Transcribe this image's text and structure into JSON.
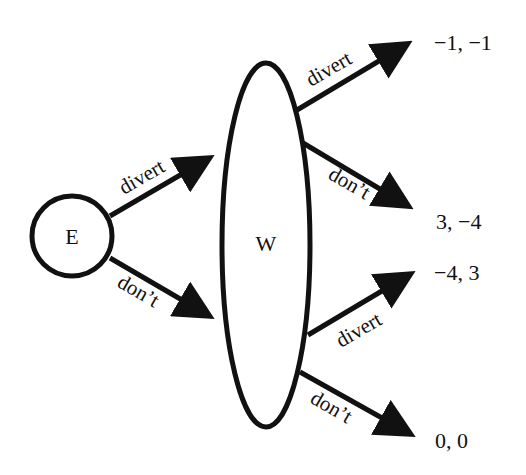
{
  "nodes": {
    "E": {
      "label": "E",
      "shape": "circle"
    },
    "W": {
      "label": "W",
      "shape": "ellipse (information set)"
    }
  },
  "edges": {
    "e_divert": {
      "from": "E",
      "to": "W",
      "label": "divert"
    },
    "e_dont": {
      "from": "E",
      "to": "W",
      "label": "don’t"
    },
    "w1_divert": {
      "from": "W",
      "label": "divert",
      "payoff": "−1, −1"
    },
    "w1_dont": {
      "from": "W",
      "label": "don’t",
      "payoff": "3, −4"
    },
    "w2_divert": {
      "from": "W",
      "label": "divert",
      "payoff": "−4, 3"
    },
    "w2_dont": {
      "from": "W",
      "label": "don’t",
      "payoff": "0, 0"
    }
  },
  "colors": {
    "ink": "#111111",
    "background": "#ffffff"
  }
}
